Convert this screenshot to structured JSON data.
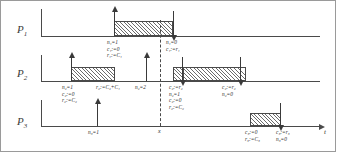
{
  "figure": {
    "type": "timing-diagram",
    "time_axis_label": "t",
    "preemption_marker": "x"
  },
  "processes": [
    {
      "name": "P",
      "index": "1",
      "label": "P"
    },
    {
      "name": "P",
      "index": "2",
      "label": "P"
    },
    {
      "name": "P",
      "index": "3",
      "label": "P"
    }
  ],
  "annotations": {
    "p1_release": [
      "n",
      "1",
      "=1",
      "c",
      "1",
      ":=0",
      "r",
      "1",
      ":=C",
      "1"
    ],
    "p1_release_lines": [
      "n₁=1",
      "c₁:=0",
      "r₁:=C₁"
    ],
    "p1_finish_lines": [
      "n₁=0",
      "c₁:=r₁"
    ],
    "p2_release_lines": [
      "n₂=1",
      "c₂:=0",
      "r₂:=C₂"
    ],
    "p2_sum_line": "r₂:=C₂+C₁",
    "p2_second_release_line": "n₂=2",
    "p2_resume_lines": [
      "c₂:=r₂",
      "n₂=1",
      "c₂:=0",
      "r₂:=C₂"
    ],
    "p2_finish_lines": [
      "c₂:=r₂",
      "n₂=0"
    ],
    "p3_release_line": "n₃=1",
    "p3_start_lines": [
      "c₃:=0",
      "r₃:=C₃"
    ],
    "p3_finish_lines": [
      "c₃:=r₃",
      "n₃=0"
    ]
  },
  "blocks": [
    {
      "process": "P1",
      "pattern": "hatch",
      "start_label": "arrow-up",
      "end_label": "arrow-down"
    },
    {
      "process": "P2",
      "pattern": "crosshatch",
      "start_label": "arrow-up",
      "end_label": "none"
    },
    {
      "process": "P2",
      "pattern": "crosshatch+hatch",
      "start_label": "arrow-down",
      "end_label": "arrow-down"
    },
    {
      "process": "P3",
      "pattern": "hatch",
      "start_label": "none",
      "end_label": "arrow-down"
    }
  ],
  "colors": {
    "stroke": "#4a4a4a",
    "text": "#2d2d2d",
    "hatch": "#6b6b6b",
    "background": "#ffffff",
    "frame": "#9a9a9a"
  }
}
